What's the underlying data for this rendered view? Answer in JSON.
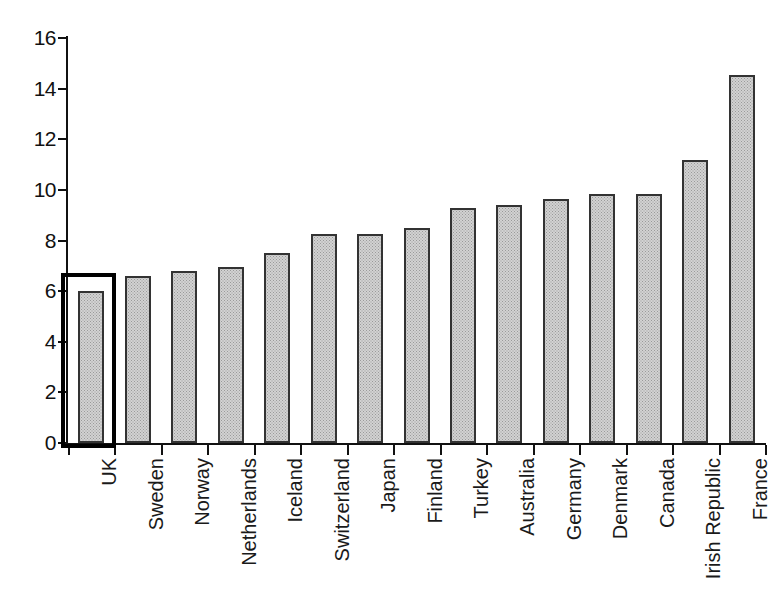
{
  "chart_data": {
    "type": "bar",
    "title": "",
    "subtitle": "",
    "xlabel": "",
    "ylabel": "",
    "ylim": [
      0,
      16
    ],
    "ytick_step": 2,
    "yticks": [
      "16",
      "14",
      "12",
      "10",
      "8",
      "6",
      "4",
      "2",
      "0"
    ],
    "grid": false,
    "legend": false,
    "legend_position": "none",
    "categories": [
      "UK",
      "Sweden",
      "Norway",
      "Netherlands",
      "Iceland",
      "Switzerland",
      "Japan",
      "Finland",
      "Turkey",
      "Australia",
      "Germany",
      "Denmark",
      "Canada",
      "Irish Republic",
      "France"
    ],
    "values": [
      6.0,
      6.6,
      6.8,
      6.95,
      7.5,
      8.25,
      8.25,
      8.5,
      9.3,
      9.4,
      9.65,
      9.85,
      9.85,
      11.2,
      14.55
    ],
    "annotations": [
      {
        "type": "highlight-rectangle",
        "target_category": "UK",
        "description": "black rectangle drawn around the first bar"
      }
    ],
    "style": {
      "bar_fill": "#d2d2d2",
      "bar_fill_pattern": "fine gray stipple",
      "bar_border": "#333333",
      "axis_color": "#111111",
      "highlight_color": "#000000",
      "background": "#ffffff",
      "text_color": "#1a1a1a"
    }
  }
}
